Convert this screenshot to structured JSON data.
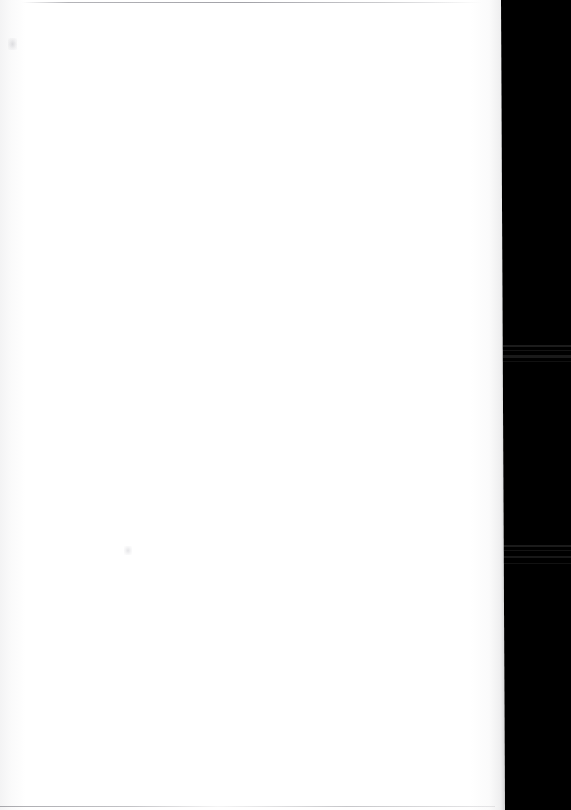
{
  "document": {
    "page_kind": "blank-scanned-page",
    "visible_text": "",
    "body_text_lines": [],
    "header_text": "",
    "footer_text": "",
    "page_number": "",
    "figures": [],
    "tables": []
  },
  "scan": {
    "width_px": 571,
    "height_px": 810,
    "paper_color": "#ffffff",
    "void_color": "#000000",
    "paper_edge_top_x": 501,
    "paper_edge_bottom_x": 505
  },
  "artifacts": {
    "top_scan_line": "",
    "bottom_scan_line": "",
    "left_margin_tint": "",
    "right_edge_shadow": "",
    "upper_left_smudge": "",
    "dust_speck": "",
    "void_streaks": [
      "",
      "",
      "",
      "",
      "",
      "",
      "",
      ""
    ]
  }
}
